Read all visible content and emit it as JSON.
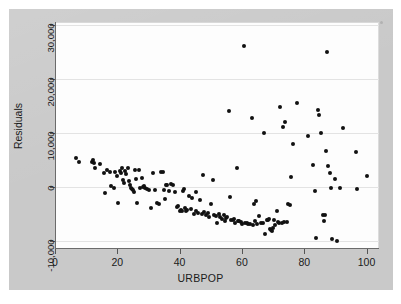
{
  "figure": {
    "background_color": "#c9c9c9",
    "panel_color": "#fdfdfd",
    "point_color": "#111111",
    "grid_color": "#e3e3e3",
    "axis_color": "#6b6b6b"
  },
  "axis_titles": {
    "x": "URBPOP",
    "y": "Residuals"
  },
  "ticks": {
    "x": [
      "0",
      "20",
      "40",
      "60",
      "80",
      "100"
    ],
    "y": [
      "-10,000",
      "0",
      "10,000",
      "20,000",
      "30,000"
    ]
  },
  "chart_data": {
    "type": "scatter",
    "title": "",
    "xlabel": "URBPOP",
    "ylabel": "Residuals",
    "xlim": [
      0,
      104
    ],
    "ylim": [
      -11500,
      30500
    ],
    "xticks": [
      0,
      20,
      40,
      60,
      80,
      100
    ],
    "yticks": [
      -10000,
      0,
      10000,
      20000,
      30000
    ],
    "grid": true,
    "grid_axis": "y",
    "legend": null,
    "marker": "filled-circle",
    "marker_color": "#111111",
    "marker_size": 4,
    "n_points": 160,
    "points": [
      [
        6.5,
        5300
      ],
      [
        7.5,
        4600
      ],
      [
        11.5,
        4600
      ],
      [
        12.0,
        4900
      ],
      [
        12.3,
        4400
      ],
      [
        12.6,
        3400
      ],
      [
        14.0,
        4300
      ],
      [
        15.3,
        2600
      ],
      [
        15.6,
        -1200
      ],
      [
        16.3,
        3200
      ],
      [
        17.2,
        2800
      ],
      [
        17.8,
        200
      ],
      [
        18.6,
        -300
      ],
      [
        19.0,
        2700
      ],
      [
        19.5,
        2100
      ],
      [
        19.8,
        -3000
      ],
      [
        20.4,
        3000
      ],
      [
        20.8,
        2500
      ],
      [
        21.2,
        3400
      ],
      [
        21.5,
        1300
      ],
      [
        21.9,
        700
      ],
      [
        22.3,
        2900
      ],
      [
        22.6,
        2400
      ],
      [
        23.0,
        3400
      ],
      [
        23.4,
        1000
      ],
      [
        23.8,
        250
      ],
      [
        24.1,
        -150
      ],
      [
        24.4,
        -450
      ],
      [
        24.6,
        -650
      ],
      [
        24.9,
        -900
      ],
      [
        25.3,
        3200
      ],
      [
        25.7,
        1400
      ],
      [
        26.0,
        -3000
      ],
      [
        26.6,
        3100
      ],
      [
        27.1,
        -250
      ],
      [
        27.5,
        1700
      ],
      [
        27.9,
        -100
      ],
      [
        28.3,
        100
      ],
      [
        28.7,
        -200
      ],
      [
        29.1,
        -400
      ],
      [
        30.0,
        -500
      ],
      [
        30.6,
        -4000
      ],
      [
        31.2,
        2600
      ],
      [
        31.8,
        -600
      ],
      [
        32.4,
        -3000
      ],
      [
        33.0,
        -3200
      ],
      [
        33.6,
        2800
      ],
      [
        34.2,
        2700
      ],
      [
        34.6,
        -600
      ],
      [
        35.0,
        -2300
      ],
      [
        35.6,
        400
      ],
      [
        36.2,
        -700
      ],
      [
        37.0,
        500
      ],
      [
        37.6,
        300
      ],
      [
        38.2,
        -1000
      ],
      [
        38.8,
        -3700
      ],
      [
        39.3,
        -3600
      ],
      [
        39.7,
        -4400
      ],
      [
        40.0,
        -4200
      ],
      [
        40.3,
        -4500
      ],
      [
        40.7,
        -700
      ],
      [
        41.0,
        -400
      ],
      [
        41.4,
        -3900
      ],
      [
        41.8,
        -4400
      ],
      [
        42.2,
        -4300
      ],
      [
        42.6,
        -1700
      ],
      [
        43.2,
        -4100
      ],
      [
        43.8,
        -2000
      ],
      [
        44.4,
        -5000
      ],
      [
        45.0,
        -4400
      ],
      [
        45.6,
        -4800
      ],
      [
        46.2,
        -2400
      ],
      [
        46.8,
        -5100
      ],
      [
        47.2,
        2200
      ],
      [
        47.6,
        -4600
      ],
      [
        48.2,
        -5300
      ],
      [
        48.8,
        -4800
      ],
      [
        49.2,
        -5600
      ],
      [
        49.8,
        -3100
      ],
      [
        50.3,
        1300
      ],
      [
        50.8,
        -5200
      ],
      [
        51.2,
        -5400
      ],
      [
        51.7,
        -6600
      ],
      [
        52.2,
        -5100
      ],
      [
        52.8,
        -5500
      ],
      [
        53.3,
        -6000
      ],
      [
        53.8,
        -5200
      ],
      [
        54.2,
        -6300
      ],
      [
        54.6,
        -5800
      ],
      [
        55.0,
        -5600
      ],
      [
        55.4,
        14100
      ],
      [
        55.8,
        -1900
      ],
      [
        56.2,
        -6100
      ],
      [
        56.8,
        -6100
      ],
      [
        57.2,
        -5900
      ],
      [
        57.6,
        -6600
      ],
      [
        58.0,
        3500
      ],
      [
        58.4,
        -6300
      ],
      [
        58.8,
        -6400
      ],
      [
        59.3,
        -6500
      ],
      [
        59.8,
        -6900
      ],
      [
        60.4,
        26000
      ],
      [
        60.8,
        -6700
      ],
      [
        61.2,
        -6600
      ],
      [
        61.6,
        -6800
      ],
      [
        62.2,
        -6900
      ],
      [
        62.8,
        12700
      ],
      [
        63.2,
        -7000
      ],
      [
        63.6,
        -3100
      ],
      [
        64.0,
        -6400
      ],
      [
        64.6,
        -6800
      ],
      [
        65.2,
        -5400
      ],
      [
        65.8,
        -6700
      ],
      [
        66.4,
        -6600
      ],
      [
        66.8,
        10000
      ],
      [
        67.2,
        -8800
      ],
      [
        67.6,
        -6200
      ],
      [
        68.0,
        -6100
      ],
      [
        68.3,
        -5900
      ],
      [
        68.6,
        -7800
      ],
      [
        69.0,
        -8000
      ],
      [
        69.3,
        -8200
      ],
      [
        69.6,
        -7600
      ],
      [
        70.0,
        -6200
      ],
      [
        70.4,
        -7100
      ],
      [
        70.8,
        -4500
      ],
      [
        71.2,
        -6500
      ],
      [
        71.6,
        -6600
      ],
      [
        72.0,
        14800
      ],
      [
        72.4,
        -6600
      ],
      [
        72.8,
        11000
      ],
      [
        73.2,
        -6500
      ],
      [
        73.6,
        12000
      ],
      [
        74.0,
        -6500
      ],
      [
        74.4,
        -3200
      ],
      [
        75.0,
        -3400
      ],
      [
        75.4,
        1800
      ],
      [
        76.0,
        7900
      ],
      [
        77.4,
        15600
      ],
      [
        80.8,
        9400
      ],
      [
        82.4,
        4000
      ],
      [
        83.2,
        -700
      ],
      [
        83.6,
        -9400
      ],
      [
        84.0,
        14200
      ],
      [
        84.4,
        13300
      ],
      [
        85.0,
        10000
      ],
      [
        85.6,
        -5300
      ],
      [
        85.9,
        -6400
      ],
      [
        86.2,
        -5200
      ],
      [
        86.8,
        6600
      ],
      [
        87.0,
        25000
      ],
      [
        87.4,
        3900
      ],
      [
        87.8,
        2500
      ],
      [
        88.2,
        -200
      ],
      [
        88.6,
        -9700
      ],
      [
        89.4,
        1400
      ],
      [
        90.2,
        -10100
      ],
      [
        91.0,
        -300
      ],
      [
        92.0,
        10800
      ],
      [
        96.2,
        6500
      ],
      [
        96.6,
        -400
      ],
      [
        99.8,
        2100
      ],
      [
        35.3,
        300
      ],
      [
        44.8,
        -900
      ],
      [
        64.2,
        -2600
      ]
    ]
  }
}
